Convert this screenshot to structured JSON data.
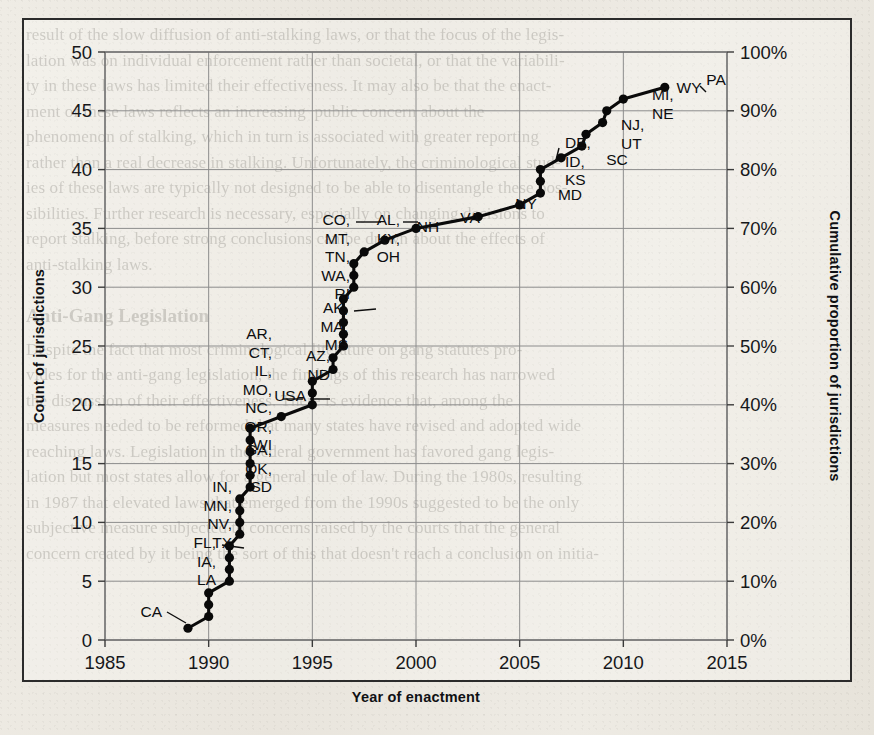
{
  "page": {
    "background_text_lines": [
      "result of the slow diffusion of anti-stalking laws, or that the focus of the legis-",
      "lation was on individual enforcement rather than societal, or that the variabili-",
      "ty in these laws has limited their effectiveness. It may also be that the enact-",
      "ment of these laws reflects an increasing  public concern about the",
      "phenomenon of stalking, which in turn is associated with greater reporting",
      "rather than a real decrease in stalking. Unfortunately, the criminological stud-",
      "ies of these laws are typically not designed to be able to disentangle these pos-",
      "sibilities. Further research is necessary, especially on changing decisions to",
      "report stalking, before strong conclusions can be drawn about the effects of",
      "anti-stalking laws."
    ],
    "background_heading": "Anti-Gang Legislation",
    "background_text_lines_2": [
      "Despite the fact that most criminological literature on gang statutes pro-",
      "vides for the anti-gang legislation, the findings of this research has narrowed",
      "the discussion of their effectiveness. There is evidence that, among the",
      "measures needed to be reformed that many states have revised and adopted wide",
      "reaching laws. Legislation in the federal government has favored gang legis-",
      "lation but most states allow for a general rule of law. During the 1980s, resulting",
      "in 1987 that elevated laws that emerged from the 1990s suggested to be the only",
      "subjective measure subjected to concerns raised by the courts that the general",
      "concern created by it being the sort of this that doesn't reach a conclusion on initia-"
    ]
  },
  "chart_data": {
    "type": "line",
    "title": "",
    "xlabel": "Year of enactment",
    "ylabel": "Count of jurisdictions",
    "ylabel_right": "Cumulative proportion of jurisdictions",
    "xlim": [
      1985,
      2015
    ],
    "ylim": [
      0,
      50
    ],
    "xticks": [
      "1985",
      "1990",
      "1995",
      "2000",
      "2005",
      "2010",
      "2015"
    ],
    "yticks": [
      "0",
      "5",
      "10",
      "15",
      "20",
      "25",
      "30",
      "35",
      "40",
      "45",
      "50"
    ],
    "yticks_right": [
      "0%",
      "10%",
      "20%",
      "30%",
      "40%",
      "50%",
      "60%",
      "70%",
      "80%",
      "90%",
      "100%"
    ],
    "grid": true,
    "legend": "none",
    "line_color": "#0a0a0a",
    "points": [
      {
        "x": 1989.0,
        "y": 1,
        "label": "CA"
      },
      {
        "x": 1990.0,
        "y": 2,
        "label": ""
      },
      {
        "x": 1990.0,
        "y": 3,
        "label": ""
      },
      {
        "x": 1990.0,
        "y": 4,
        "label": ""
      },
      {
        "x": 1991.0,
        "y": 5,
        "label": "FL, IA, LA"
      },
      {
        "x": 1991.0,
        "y": 6,
        "label": ""
      },
      {
        "x": 1991.0,
        "y": 7,
        "label": ""
      },
      {
        "x": 1991.0,
        "y": 8,
        "label": ""
      },
      {
        "x": 1991.5,
        "y": 9,
        "label": "IN, MN, NV, TX"
      },
      {
        "x": 1991.5,
        "y": 10,
        "label": ""
      },
      {
        "x": 1991.5,
        "y": 11,
        "label": ""
      },
      {
        "x": 1991.5,
        "y": 12,
        "label": ""
      },
      {
        "x": 1992.0,
        "y": 13,
        "label": "GA, OK, SD"
      },
      {
        "x": 1992.0,
        "y": 14,
        "label": ""
      },
      {
        "x": 1992.0,
        "y": 15,
        "label": ""
      },
      {
        "x": 1992.0,
        "y": 16,
        "label": ""
      },
      {
        "x": 1992.0,
        "y": 17,
        "label": ""
      },
      {
        "x": 1992.0,
        "y": 18,
        "label": "AR, CT, IL, MO, NC, OR, WI"
      },
      {
        "x": 1993.5,
        "y": 19,
        "label": "USA"
      },
      {
        "x": 1995.0,
        "y": 20,
        "label": ""
      },
      {
        "x": 1995.0,
        "y": 21,
        "label": ""
      },
      {
        "x": 1995.0,
        "y": 22,
        "label": "AZ, ND"
      },
      {
        "x": 1996.0,
        "y": 23,
        "label": ""
      },
      {
        "x": 1996.0,
        "y": 24,
        "label": ""
      },
      {
        "x": 1996.5,
        "y": 25,
        "label": "AK, MA, MS"
      },
      {
        "x": 1996.5,
        "y": 26,
        "label": ""
      },
      {
        "x": 1996.5,
        "y": 27,
        "label": ""
      },
      {
        "x": 1996.5,
        "y": 28,
        "label": ""
      },
      {
        "x": 1996.5,
        "y": 29,
        "label": ""
      },
      {
        "x": 1997.0,
        "y": 30,
        "label": "CO, MT, TN, WA, RI"
      },
      {
        "x": 1997.0,
        "y": 31,
        "label": ""
      },
      {
        "x": 1997.0,
        "y": 32,
        "label": ""
      },
      {
        "x": 1997.5,
        "y": 33,
        "label": "AL, KY, OH"
      },
      {
        "x": 1998.5,
        "y": 34,
        "label": "NH"
      },
      {
        "x": 2000.0,
        "y": 35,
        "label": "VA"
      },
      {
        "x": 2003.0,
        "y": 36,
        "label": "NY"
      },
      {
        "x": 2005.0,
        "y": 37,
        "label": "MD"
      },
      {
        "x": 2006.0,
        "y": 38,
        "label": ""
      },
      {
        "x": 2006.0,
        "y": 39,
        "label": ""
      },
      {
        "x": 2006.0,
        "y": 40,
        "label": "DE, ID, KS"
      },
      {
        "x": 2007.0,
        "y": 41,
        "label": "SC"
      },
      {
        "x": 2008.0,
        "y": 42,
        "label": ""
      },
      {
        "x": 2008.2,
        "y": 43,
        "label": "NJ, UT"
      },
      {
        "x": 2009.0,
        "y": 44,
        "label": ""
      },
      {
        "x": 2009.2,
        "y": 45,
        "label": "MI, NE"
      },
      {
        "x": 2010.0,
        "y": 46,
        "label": "WY"
      },
      {
        "x": 2012.0,
        "y": 47,
        "label": "PA"
      }
    ],
    "annotations": [
      {
        "text": "CA",
        "x": 162,
        "y": 617,
        "anchor": "end",
        "lines": [
          "CA"
        ]
      },
      {
        "text": "FL, IA, LA",
        "x": 216,
        "y": 548,
        "anchor": "end",
        "lines": [
          "FL,",
          "IA,",
          "LA"
        ]
      },
      {
        "text": "IN, MN, NV, TX",
        "x": 232,
        "y": 492,
        "anchor": "end",
        "lines": [
          "IN,",
          "MN,",
          "NV,",
          "TX"
        ]
      },
      {
        "text": "GA, OK, SD",
        "x": 272,
        "y": 455,
        "anchor": "end",
        "lines": [
          "GA,",
          "OK,",
          "SD"
        ]
      },
      {
        "text": "AR, CT, IL, MO, NC, OR, WI",
        "x": 272,
        "y": 339,
        "anchor": "end",
        "lines": [
          "AR,",
          "CT,",
          "IL,",
          "MO,",
          "NC,",
          "OR,",
          "WI"
        ]
      },
      {
        "text": "USA",
        "x": 306,
        "y": 401,
        "anchor": "end",
        "lines": [
          "USA"
        ]
      },
      {
        "text": "AZ, ND",
        "x": 330,
        "y": 361,
        "anchor": "end",
        "lines": [
          "AZ,",
          "ND"
        ]
      },
      {
        "text": "AK, MA, MS",
        "x": 348,
        "y": 313,
        "anchor": "end",
        "lines": [
          "AK,",
          "MA,",
          "MS"
        ]
      },
      {
        "text": "CO, MT, TN, WA, RI",
        "x": 350,
        "y": 225,
        "anchor": "end",
        "lines": [
          "CO,",
          "MT,",
          "TN,",
          "WA,",
          "RI"
        ]
      },
      {
        "text": "AL, KY, OH",
        "x": 400,
        "y": 225,
        "anchor": "end",
        "lines": [
          "AL,",
          "KY,",
          "OH"
        ]
      },
      {
        "text": "NH",
        "x": 428,
        "y": 232,
        "anchor": "middle",
        "lines": [
          "NH"
        ]
      },
      {
        "text": "VA",
        "x": 470,
        "y": 223,
        "anchor": "middle",
        "lines": [
          "VA"
        ]
      },
      {
        "text": "NY",
        "x": 526,
        "y": 209,
        "anchor": "middle",
        "lines": [
          "NY"
        ]
      },
      {
        "text": "MD",
        "x": 570,
        "y": 200,
        "anchor": "middle",
        "lines": [
          "MD"
        ]
      },
      {
        "text": "DE, ID, KS",
        "x": 565,
        "y": 148,
        "anchor": "start",
        "lines": [
          "DE,",
          "ID,",
          "KS"
        ]
      },
      {
        "text": "SC",
        "x": 617,
        "y": 165,
        "anchor": "middle",
        "lines": [
          "SC"
        ]
      },
      {
        "text": "NJ, UT",
        "x": 621,
        "y": 130,
        "anchor": "start",
        "lines": [
          "NJ,",
          "UT"
        ]
      },
      {
        "text": "MI, NE",
        "x": 652,
        "y": 100,
        "anchor": "start",
        "lines": [
          "MI,",
          "NE"
        ]
      },
      {
        "text": "WY",
        "x": 689,
        "y": 93,
        "anchor": "middle",
        "lines": [
          "WY"
        ]
      },
      {
        "text": "PA",
        "x": 716,
        "y": 85,
        "anchor": "middle",
        "lines": [
          "PA"
        ]
      }
    ]
  }
}
